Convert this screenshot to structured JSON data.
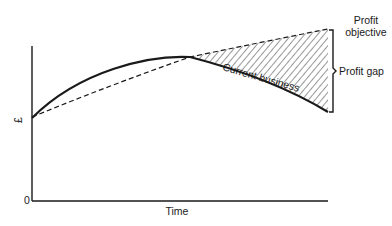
{
  "diagram": {
    "y_axis_label": "£",
    "y_origin_label": "0",
    "x_axis_label": "Time",
    "curves": {
      "profit_objective": {
        "label_line1": "Profit",
        "label_line2": "objective",
        "style": "dashed"
      },
      "current_business": {
        "label": "Current business",
        "style": "solid"
      }
    },
    "gap": {
      "label": "Profit gap",
      "fill": "hatched"
    },
    "colors": {
      "ink": "#1a1a1a",
      "background": "#ffffff"
    }
  }
}
